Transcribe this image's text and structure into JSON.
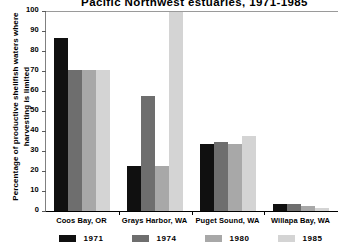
{
  "chart_data": {
    "type": "bar",
    "title": "Pacific Northwest estuaries, 1971-1985",
    "xlabel": "",
    "ylabel": "Percentage of productive shellfish waters where harvesting is limited",
    "ylim": [
      0,
      100
    ],
    "yticks": [
      0,
      10,
      20,
      30,
      40,
      50,
      60,
      70,
      80,
      90,
      100
    ],
    "grid": false,
    "legend_position": "bottom",
    "categories": [
      "Coos Bay, OR",
      "Grays Harbor, WA",
      "Puget Sound, WA",
      "Willapa Bay, WA"
    ],
    "series": [
      {
        "name": "1971",
        "color": "#101010",
        "values": [
          87,
          23,
          34,
          4
        ]
      },
      {
        "name": "1974",
        "color": "#6e6e6e",
        "values": [
          71,
          58,
          35,
          4
        ]
      },
      {
        "name": "1980",
        "color": "#a8a8a8",
        "values": [
          71,
          23,
          34,
          3
        ]
      },
      {
        "name": "1985",
        "color": "#d4d4d4",
        "values": [
          71,
          100,
          38,
          2
        ]
      }
    ]
  }
}
